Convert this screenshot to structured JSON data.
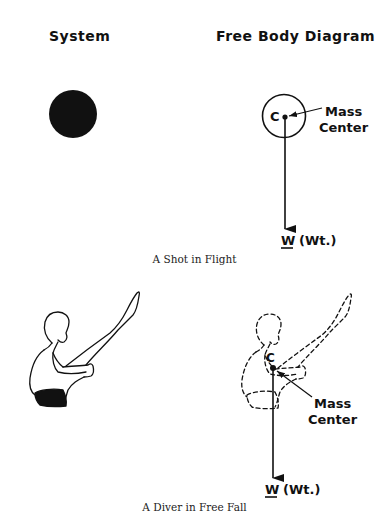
{
  "headings": {
    "system": "System",
    "free_body_diagram": "Free Body Diagram"
  },
  "panels": [
    {
      "caption": "A Shot in Flight",
      "system_shape": "filled-circle",
      "fbd": {
        "center_label": "C",
        "mass_center_line1": "Mass",
        "mass_center_line2": "Center",
        "weight_symbol": "W",
        "weight_label": "(Wt.)"
      }
    },
    {
      "caption": "A Diver in Free Fall",
      "system_shape": "diver-pike-position",
      "fbd": {
        "center_label": "C",
        "mass_center_line1": "Mass",
        "mass_center_line2": "Center",
        "weight_symbol": "W",
        "weight_label": "(Wt.)"
      }
    }
  ],
  "colors": {
    "ink": "#111111",
    "background": "#ffffff"
  }
}
